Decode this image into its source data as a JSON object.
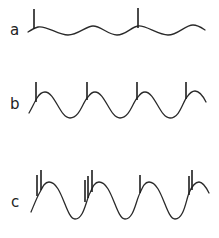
{
  "figure": {
    "rows": [
      {
        "label": "a",
        "wave": "M28,32 C31,30 34,28 38,27 C46,25 58,35 68,35 C78,35 86,26 93,26 C101,26 108,35 117,35 C126,35 131,27 138,26 C146,25 158,35 168,35 C178,35 185,25 193,25 C198,25 202,28 205,30",
        "spikes": [
          {
            "x": 34,
            "y1": 9,
            "y2": 29
          },
          {
            "x": 138,
            "y1": 8,
            "y2": 28
          }
        ]
      },
      {
        "label": "b",
        "wave": "M29,113 C32,108 35,101 37,98 C40,93 42,92 45,92 C55,92 60,118 70,118 C80,118 83,101 88,97 C90,94 92,92 95,92 C105,92 110,118 120,118 C130,118 133,101 138,97 C140,94 142,92 145,92 C155,92 160,118 170,118 C180,118 183,101 187,97 C189,94 192,91 195,91 C200,91 203,96 206,102",
        "spikes": [
          {
            "x": 36,
            "y1": 82,
            "y2": 102
          },
          {
            "x": 87,
            "y1": 82,
            "y2": 100
          },
          {
            "x": 137,
            "y1": 82,
            "y2": 100
          },
          {
            "x": 186,
            "y1": 82,
            "y2": 99
          }
        ]
      },
      {
        "label": "c",
        "wave": "M31,212 C34,205 37,197 40,192 C43,186 45,182 49,182 C62,182 66,219 75,219 C84,219 86,200 90,193 C93,186 95,182 99,182 C112,182 116,219 125,219 C134,219 136,200 140,193 C143,186 145,182 149,182 C162,182 166,219 175,219 C184,219 186,200 189,193 C192,186 195,182 199,182 C203,182 206,187 209,193",
        "spikes": [
          {
            "x": 37,
            "y1": 175,
            "y2": 196
          },
          {
            "x": 41,
            "y1": 170,
            "y2": 190
          },
          {
            "x": 85,
            "y1": 180,
            "y2": 202
          },
          {
            "x": 88,
            "y1": 176,
            "y2": 198
          },
          {
            "x": 92,
            "y1": 170,
            "y2": 192
          },
          {
            "x": 140,
            "y1": 175,
            "y2": 193
          },
          {
            "x": 189,
            "y1": 176,
            "y2": 195
          },
          {
            "x": 192,
            "y1": 170,
            "y2": 190
          }
        ]
      }
    ],
    "label_positions": [
      {
        "x": 10,
        "y": 23
      },
      {
        "x": 10,
        "y": 97
      },
      {
        "x": 11,
        "y": 195
      }
    ],
    "stroke_color": "#2a2a2a",
    "background": "#ffffff"
  }
}
